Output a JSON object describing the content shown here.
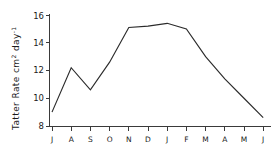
{
  "chart_data": {
    "type": "line",
    "title": "",
    "xlabel": "",
    "ylabel": "Tatter Rate cm 2 day -1",
    "ylabel_parts": {
      "text_before": "Tatter Rate cm",
      "sup1": "2",
      "text_mid": " day",
      "sup2": "-1"
    },
    "categories": [
      "J",
      "A",
      "S",
      "O",
      "N",
      "D",
      "J",
      "F",
      "M",
      "A",
      "M",
      "J"
    ],
    "x": [
      1,
      2,
      3,
      4,
      5,
      6,
      7,
      8,
      9,
      10,
      11,
      12
    ],
    "values": [
      9.0,
      12.2,
      10.6,
      12.6,
      15.1,
      15.2,
      15.4,
      15.0,
      13.0,
      11.4,
      10.0,
      8.6
    ],
    "series": [
      {
        "name": "Tatter Rate",
        "values": [
          9.0,
          12.2,
          10.6,
          12.6,
          15.1,
          15.2,
          15.4,
          15.0,
          13.0,
          11.4,
          10.0,
          8.6
        ]
      }
    ],
    "ylim": [
      7.4,
      16.4
    ],
    "yticks": [
      8,
      10,
      12,
      14,
      16
    ],
    "ytick_labels": [
      "8",
      "10",
      "12",
      "14",
      "16"
    ],
    "xlim": [
      0.55,
      12.45
    ],
    "grid": false,
    "legend": false,
    "legend_position": "none",
    "line_color": "#2b2b2b",
    "axis_color": "#3a3a3a",
    "background_color": "#ffffff"
  }
}
